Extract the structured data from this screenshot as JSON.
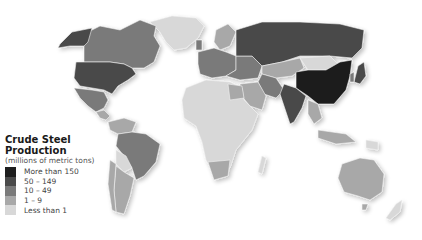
{
  "legend": {
    "title_line1": "Crude Steel",
    "title_line2": "Production",
    "subtitle": "(millions of metric tons)",
    "items": [
      {
        "label": "More than 150",
        "color": "#1e1e1e"
      },
      {
        "label": "50 – 149",
        "color": "#4a4a4a"
      },
      {
        "label": "10 – 49",
        "color": "#7a7a7a"
      },
      {
        "label": "1 – 9",
        "color": "#a8a8a8"
      },
      {
        "label": "Less than 1",
        "color": "#d8d8d8"
      }
    ]
  },
  "regions": {
    "more_than_150": [
      "China"
    ],
    "50_149": [
      "United States",
      "Russia",
      "India",
      "Japan",
      "Alaska (US)"
    ],
    "10_49": [
      "Canada",
      "Mexico",
      "Brazil",
      "Western Europe",
      "Ukraine",
      "Turkey",
      "Iran",
      "South Korea",
      "Taiwan"
    ],
    "1_9": [
      "Kazakhstan",
      "Argentina",
      "Venezuela",
      "Chile",
      "Australia",
      "Egypt",
      "Saudi Arabia",
      "South Africa",
      "Indonesia",
      "Scandinavia"
    ],
    "less_than_1": [
      "Greenland",
      "Most of Africa",
      "Mongolia",
      "Central Asia",
      "Bolivia",
      "Paraguay",
      "New Zealand",
      "Papua New Guinea"
    ]
  }
}
